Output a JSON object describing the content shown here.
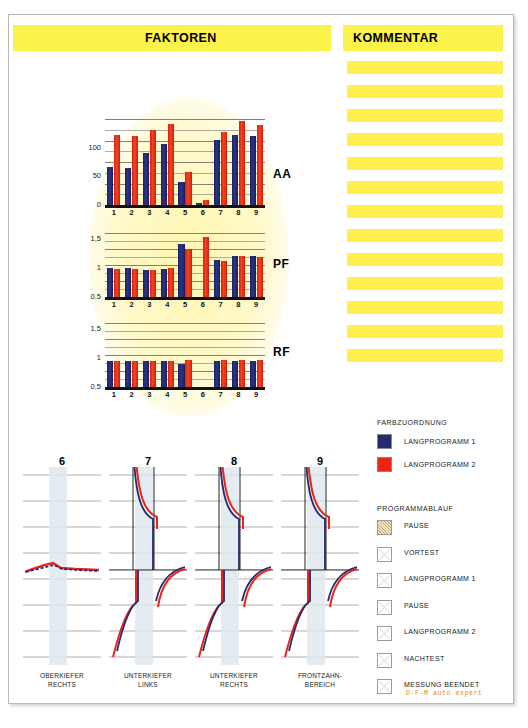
{
  "header": {
    "faktoren": "FAKTOREN",
    "kommentar": "KOMMENTAR"
  },
  "comments": {
    "count": 13,
    "lines": [
      "",
      "",
      "",
      "",
      "",
      "",
      "",
      "",
      "",
      "",
      "",
      "",
      ""
    ]
  },
  "chart_data": [
    {
      "type": "bar",
      "title": "AA",
      "categories": [
        "1",
        "2",
        "3",
        "4",
        "5",
        "6",
        "7",
        "8",
        "9"
      ],
      "ylabel": "",
      "xlabel": "",
      "ylim": [
        0,
        150
      ],
      "yticks": [
        "100",
        "50",
        "0"
      ],
      "ytick_values": [
        100,
        50,
        0
      ],
      "grid": true,
      "series": [
        {
          "name": "LANGPROGRAMM 1",
          "color": "#232a6e",
          "values": [
            66,
            65,
            90,
            107,
            41,
            3,
            113,
            122,
            121
          ]
        },
        {
          "name": "LANGPROGRAMM 2",
          "color": "#ec2418",
          "values": [
            122,
            120,
            131,
            141,
            57,
            9,
            127,
            146,
            139
          ]
        }
      ]
    },
    {
      "type": "bar",
      "title": "PF",
      "categories": [
        "1",
        "2",
        "3",
        "4",
        "5",
        "6",
        "7",
        "8",
        "9"
      ],
      "ylabel": "",
      "xlabel": "",
      "ylim": [
        0.5,
        1.6
      ],
      "yticks": [
        "1,5",
        "1",
        "0,5"
      ],
      "ytick_values": [
        1.5,
        1.0,
        0.5
      ],
      "grid": true,
      "series": [
        {
          "name": "LANGPROGRAMM 1",
          "color": "#232a6e",
          "values": [
            1.0,
            1.0,
            0.96,
            0.99,
            1.42,
            null,
            1.13,
            1.2,
            1.2
          ]
        },
        {
          "name": "LANGPROGRAMM 2",
          "color": "#ec2418",
          "values": [
            0.98,
            0.98,
            0.96,
            1.0,
            1.32,
            1.53,
            1.12,
            1.2,
            1.18
          ]
        }
      ]
    },
    {
      "type": "bar",
      "title": "RF",
      "categories": [
        "1",
        "2",
        "3",
        "4",
        "5",
        "6",
        "7",
        "8",
        "9"
      ],
      "ylabel": "",
      "xlabel": "",
      "ylim": [
        0.5,
        1.6
      ],
      "yticks": [
        "1,5",
        "1",
        "0,5"
      ],
      "ytick_values": [
        1.5,
        1.0,
        0.5
      ],
      "grid": true,
      "series": [
        {
          "name": "LANGPROGRAMM 1",
          "color": "#232a6e",
          "values": [
            0.94,
            0.94,
            0.94,
            0.95,
            0.9,
            null,
            0.94,
            0.95,
            0.95
          ]
        },
        {
          "name": "LANGPROGRAMM 2",
          "color": "#ec2418",
          "values": [
            0.95,
            0.95,
            0.95,
            0.95,
            0.96,
            null,
            0.96,
            0.97,
            0.96
          ]
        }
      ]
    }
  ],
  "waveforms": [
    {
      "number": "6",
      "caption_line1": "OBERKIEFER",
      "caption_line2": "RECHTS",
      "shape": "flat"
    },
    {
      "number": "7",
      "caption_line1": "UNTERKIEFER",
      "caption_line2": "LINKS",
      "shape": "s-curve"
    },
    {
      "number": "8",
      "caption_line1": "UNTERKIEFER",
      "caption_line2": "RECHTS",
      "shape": "s-curve"
    },
    {
      "number": "9",
      "caption_line1": "FRONTZAHN-",
      "caption_line2": "BEREICH",
      "shape": "s-curve"
    }
  ],
  "legend": {
    "title": "FARBZUORDNUNG",
    "items": [
      {
        "label": "LANGPROGRAMM 1",
        "color": "#232a6e"
      },
      {
        "label": "LANGPROGRAMM 2",
        "color": "#ec2418"
      }
    ]
  },
  "flow": {
    "title": "PROGRAMMABLAUF",
    "steps": [
      {
        "label": "PAUSE",
        "state": "hatched"
      },
      {
        "label": "VORTEST",
        "state": "x"
      },
      {
        "label": "LANGPROGRAMM 1",
        "state": "x"
      },
      {
        "label": "PAUSE",
        "state": "x"
      },
      {
        "label": "LANGPROGRAMM 2",
        "state": "x"
      },
      {
        "label": "NACHTEST",
        "state": "x"
      },
      {
        "label": "MESSUNG BEENDET",
        "state": "x",
        "sublabel": "D-F-M auto expert"
      }
    ]
  },
  "colors": {
    "header_yellow": "#fbf24a",
    "comment_yellow": "#fdf04f",
    "program1_blue": "#232a6e",
    "program2_red": "#ec2418",
    "accent_orange": "#d88a1c"
  }
}
